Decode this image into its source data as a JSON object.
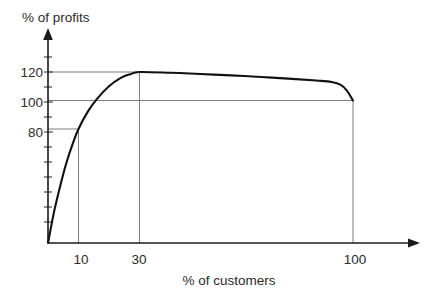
{
  "chart_data": {
    "type": "line",
    "title": "",
    "subtitle": "",
    "xlabel": "% of customers",
    "ylabel": "% of profits",
    "xlim": [
      0,
      118
    ],
    "ylim": [
      0,
      160
    ],
    "grid": false,
    "legend": null,
    "x_ticks": [
      10,
      30,
      100
    ],
    "x_tick_labels": [
      "10",
      "30",
      "100"
    ],
    "y_ticks": [
      80,
      100,
      120
    ],
    "y_tick_labels": [
      "80",
      "100",
      "120"
    ],
    "y_minor_tick_step": 10,
    "series": [
      {
        "name": "cumulative profit curve",
        "x": [
          0,
          2,
          4,
          6,
          8,
          10,
          13,
          16,
          20,
          24,
          27,
          30,
          40,
          50,
          60,
          70,
          80,
          88,
          93,
          96,
          98,
          100
        ],
        "values": [
          0,
          22,
          40,
          56,
          69,
          80,
          92,
          101,
          110,
          116,
          118.5,
          120,
          119.5,
          118.6,
          117.6,
          116.5,
          115.2,
          114,
          113,
          111,
          107,
          100
        ]
      }
    ],
    "annotations": [
      {
        "name": "reference-80",
        "kind": "horizontal-line",
        "y": 80,
        "x_from": 0,
        "x_to": 10
      },
      {
        "name": "reference-100",
        "kind": "horizontal-line",
        "y": 100,
        "x_from": 0,
        "x_to": 100
      },
      {
        "name": "reference-120",
        "kind": "horizontal-line",
        "y": 120,
        "x_from": 0,
        "x_to": 30
      },
      {
        "name": "drop-10",
        "kind": "vertical-line",
        "x": 10,
        "y_from": 0,
        "y_to": 80
      },
      {
        "name": "drop-30",
        "kind": "vertical-line",
        "x": 30,
        "y_from": 0,
        "y_to": 120
      },
      {
        "name": "drop-100",
        "kind": "vertical-line",
        "x": 100,
        "y_from": 0,
        "y_to": 100
      }
    ],
    "key_points": [
      {
        "label": "10% of customers",
        "x": 10,
        "y": 80
      },
      {
        "label": "30% of customers",
        "x": 30,
        "y": 120
      },
      {
        "label": "100% of customers",
        "x": 100,
        "y": 100
      }
    ],
    "colors": {
      "curve": "#111111",
      "axis": "#1a1a1a",
      "reference": "#7d7d7d",
      "text": "#2b2b2b",
      "background": "#ffffff"
    }
  }
}
